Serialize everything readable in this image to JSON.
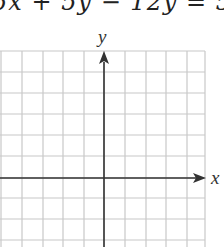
{
  "equation": {
    "text": "5x² + 5y² − 12y = 5",
    "visible_text": "5x   + 5y   − 12y = 5"
  },
  "graph": {
    "x_axis_label": "x",
    "y_axis_label": "y",
    "grid": {
      "vertical_lines_x": [
        1,
        22,
        43,
        63,
        84,
        104,
        125,
        146,
        166,
        187,
        205
      ],
      "horizontal_lines_y": [
        51,
        72,
        93,
        114,
        135,
        156,
        178,
        198,
        219,
        240,
        247
      ],
      "grid_color": "#c8c8c8",
      "axis_color": "#333333"
    },
    "origin": {
      "x": 104,
      "y": 178
    }
  }
}
